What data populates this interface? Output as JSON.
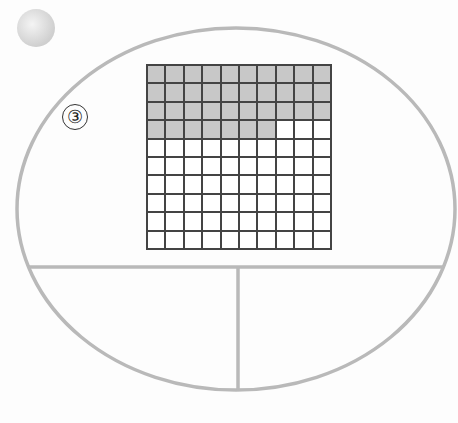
{
  "problem": {
    "number_label": "③",
    "grid": {
      "rows": 10,
      "cols": 10,
      "shaded_count": 37,
      "total": 100,
      "shaded_color": "#c8c8c8",
      "line_color": "#444444"
    },
    "answer_regions": {
      "count": 2,
      "left": "",
      "right": ""
    }
  },
  "colors": {
    "ellipse_stroke": "#b9b9b9",
    "bullet_fill": "#dcdcdc"
  }
}
